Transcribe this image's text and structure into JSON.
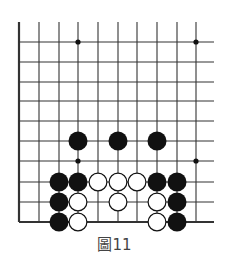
{
  "figure": {
    "caption": "圖11",
    "board": {
      "columns_x": [
        19,
        39,
        59,
        78,
        98,
        118,
        137,
        157,
        177,
        196
      ],
      "rows_y": [
        42,
        62,
        82,
        101,
        121,
        141,
        161,
        182,
        202,
        222
      ],
      "vertical_top_y": 22,
      "horizontal_right_x": 214,
      "edges": [
        "left",
        "bottom"
      ],
      "line_color": "#333333",
      "stone_radius": 9.5,
      "star_points": [
        {
          "col": 3,
          "row": 0
        },
        {
          "col": 9,
          "row": 0
        },
        {
          "col": 3,
          "row": 6
        },
        {
          "col": 9,
          "row": 6
        }
      ],
      "black_stones": [
        {
          "col": 3,
          "row": 5
        },
        {
          "col": 5,
          "row": 5
        },
        {
          "col": 7,
          "row": 5
        },
        {
          "col": 2,
          "row": 7
        },
        {
          "col": 3,
          "row": 7
        },
        {
          "col": 7,
          "row": 7
        },
        {
          "col": 8,
          "row": 7
        },
        {
          "col": 2,
          "row": 8
        },
        {
          "col": 8,
          "row": 8
        },
        {
          "col": 2,
          "row": 9
        },
        {
          "col": 8,
          "row": 9
        }
      ],
      "white_stones": [
        {
          "col": 4,
          "row": 7
        },
        {
          "col": 5,
          "row": 7
        },
        {
          "col": 6,
          "row": 7
        },
        {
          "col": 3,
          "row": 8
        },
        {
          "col": 5,
          "row": 8
        },
        {
          "col": 7,
          "row": 8
        },
        {
          "col": 3,
          "row": 9
        },
        {
          "col": 7,
          "row": 9
        }
      ],
      "colors": {
        "black_stone": "#111111",
        "white_stone": "#ffffff",
        "white_outline": "#111111"
      }
    }
  }
}
